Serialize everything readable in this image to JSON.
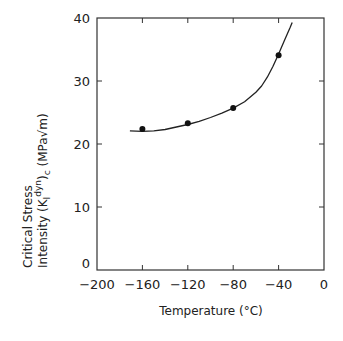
{
  "chart_data": {
    "type": "scatter",
    "title": "",
    "xlabel": "Temperature (°C)",
    "ylabel_lines": [
      "Critical  Stress",
      "Intensity  (K",
      "I",
      "dyn",
      ")",
      "c",
      "  (MPa√m)"
    ],
    "ylabel": "Critical Stress Intensity (K_I^dyn)_c (MPa√m)",
    "xlim": [
      -200,
      0
    ],
    "ylim": [
      0,
      40
    ],
    "xticks": [
      -200,
      -160,
      -120,
      -80,
      -40,
      0
    ],
    "xtick_labels": [
      "−200",
      "−160",
      "−120",
      "−80",
      "−40",
      "0"
    ],
    "yticks": [
      0,
      10,
      20,
      30,
      40
    ],
    "ytick_labels": [
      "0",
      "10",
      "20",
      "30",
      "40"
    ],
    "grid": false,
    "legend": null,
    "series": [
      {
        "name": "measured",
        "kind": "points",
        "x": [
          -160,
          -120,
          -80,
          -40
        ],
        "y": [
          22.4,
          23.3,
          25.7,
          34.1
        ]
      },
      {
        "name": "fit",
        "kind": "curve",
        "x": [
          -171,
          -160,
          -150,
          -140,
          -130,
          -120,
          -110,
          -100,
          -90,
          -80,
          -70,
          -60,
          -55,
          -50,
          -45,
          -40,
          -35,
          -30,
          -28
        ],
        "y": [
          22.1,
          22.0,
          22.1,
          22.3,
          22.7,
          23.1,
          23.6,
          24.2,
          24.9,
          25.7,
          26.7,
          28.2,
          29.2,
          30.6,
          32.3,
          34.3,
          36.4,
          38.4,
          39.3
        ]
      }
    ],
    "colors": {
      "line": "#222222",
      "marker": "#111111",
      "axis": "#333333"
    }
  }
}
